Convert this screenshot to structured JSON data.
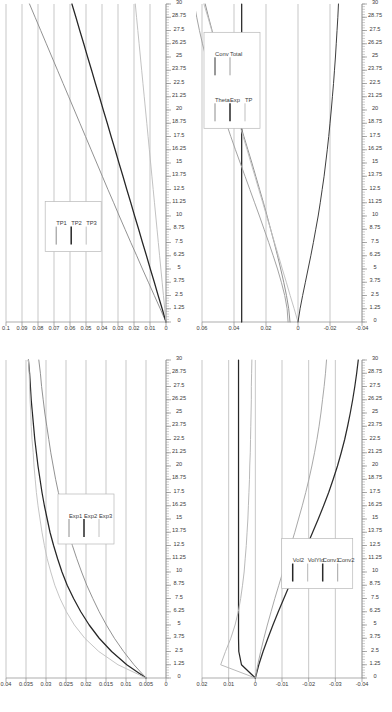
{
  "figure": {
    "layout": "2x2 grid of rotated line charts",
    "rotation_degrees": -90,
    "background": "#ffffff",
    "axis_color": "#8a8a8a",
    "grid_color": "#b0b0b0"
  },
  "x_axis_shared": {
    "label": "",
    "min": 0,
    "max": 30,
    "major_step": 1.25,
    "ticks": [
      "0",
      "1.25",
      "2.5",
      "3.75",
      "5",
      "6.25",
      "7.5",
      "8.75",
      "10",
      "11.25",
      "12.5",
      "13.75",
      "15",
      "16.25",
      "17.5",
      "18.75",
      "20",
      "21.25",
      "22.5",
      "23.75",
      "25",
      "26.25",
      "27.5",
      "28.75",
      "30"
    ]
  },
  "chart_data": [
    {
      "id": "panel-top-left",
      "type": "line",
      "title": "",
      "xlabel": "",
      "ylabel": "",
      "xlim": [
        0,
        30
      ],
      "ylim": [
        0,
        0.1
      ],
      "grid": true,
      "legend_position": "center-left",
      "x_ticks": [
        "0",
        "1.25",
        "2.5",
        "3.75",
        "5",
        "6.25",
        "7.5",
        "8.75",
        "10",
        "11.25",
        "12.5",
        "13.75",
        "15",
        "16.25",
        "17.5",
        "18.75",
        "20",
        "21.25",
        "22.5",
        "23.75",
        "25",
        "26.25",
        "27.5",
        "28.75",
        "30"
      ],
      "y_ticks": [
        "0",
        "0.01",
        "0.02",
        "0.03",
        "0.04",
        "0.05",
        "0.06",
        "0.07",
        "0.08",
        "0.09",
        "0.1"
      ],
      "x": [
        0,
        1.25,
        2.5,
        3.75,
        5,
        6.25,
        7.5,
        8.75,
        10,
        11.25,
        12.5,
        13.75,
        15,
        16.25,
        17.5,
        18.75,
        20,
        21.25,
        22.5,
        23.75,
        25,
        26.25,
        27.5,
        28.75,
        30
      ],
      "series": [
        {
          "name": "TP1",
          "color": "#8c8c8c",
          "values": [
            0,
            0.0036,
            0.0073,
            0.011,
            0.0147,
            0.0183,
            0.022,
            0.0256,
            0.0292,
            0.0327,
            0.0363,
            0.0398,
            0.0433,
            0.0468,
            0.0503,
            0.0538,
            0.0573,
            0.0608,
            0.0643,
            0.0678,
            0.0713,
            0.0748,
            0.0783,
            0.0818,
            0.0853
          ]
        },
        {
          "name": "TP2",
          "color": "#262626",
          "values": [
            0,
            0.0024,
            0.0049,
            0.0073,
            0.0098,
            0.0122,
            0.0147,
            0.0171,
            0.0196,
            0.022,
            0.0245,
            0.0269,
            0.0294,
            0.0318,
            0.0343,
            0.0367,
            0.0392,
            0.0416,
            0.0441,
            0.0465,
            0.049,
            0.0514,
            0.0539,
            0.0563,
            0.0588
          ]
        },
        {
          "name": "TP3",
          "color": "#bfbfbf",
          "values": [
            0,
            0.0008,
            0.0016,
            0.0024,
            0.0032,
            0.004,
            0.0048,
            0.0056,
            0.0064,
            0.0072,
            0.008,
            0.0088,
            0.0096,
            0.0104,
            0.0112,
            0.012,
            0.0128,
            0.0136,
            0.0144,
            0.0152,
            0.016,
            0.0168,
            0.0176,
            0.0184,
            0.0192
          ]
        }
      ]
    },
    {
      "id": "panel-top-right",
      "type": "line",
      "title": "",
      "xlabel": "",
      "ylabel": "",
      "xlim": [
        0,
        30
      ],
      "ylim": [
        -0.04,
        0.06
      ],
      "grid": true,
      "legend_position": "upper-right",
      "legend_columns": 2,
      "x_ticks": [
        "0",
        "1.25",
        "2.5",
        "3.75",
        "5",
        "6.25",
        "7.5",
        "8.75",
        "10",
        "11.25",
        "12.5",
        "13.75",
        "15",
        "16.25",
        "17.5",
        "18.75",
        "20",
        "21.25",
        "22.5",
        "23.75",
        "25",
        "26.25",
        "27.5",
        "28.75",
        "30"
      ],
      "y_ticks": [
        "-0.04",
        "-0.02",
        "0",
        "0.02",
        "0.04",
        "0.06"
      ],
      "x": [
        0,
        1.25,
        2.5,
        3.75,
        5,
        6.25,
        7.5,
        8.75,
        10,
        11.25,
        12.5,
        13.75,
        15,
        16.25,
        17.5,
        18.75,
        20,
        21.25,
        22.5,
        23.75,
        25,
        26.25,
        27.5,
        28.75,
        30
      ],
      "series": [
        {
          "name": "Theta",
          "color": "#8c8c8c",
          "values": [
            0.005,
            0.0058,
            0.0072,
            0.0089,
            0.0108,
            0.0128,
            0.0149,
            0.0171,
            0.0193,
            0.0216,
            0.024,
            0.0264,
            0.0288,
            0.0313,
            0.0338,
            0.0363,
            0.0389,
            0.0414,
            0.044,
            0.0465,
            0.049,
            0.0514,
            0.0537,
            0.0559,
            0.058
          ]
        },
        {
          "name": "Exp",
          "color": "#262626",
          "values": [
            0.0352,
            0.0352,
            0.0352,
            0.0352,
            0.0352,
            0.0352,
            0.0352,
            0.0352,
            0.0352,
            0.0352,
            0.0352,
            0.0352,
            0.0352,
            0.0352,
            0.0352,
            0.0352,
            0.0352,
            0.0352,
            0.0352,
            0.0352,
            0.0352,
            0.0352,
            0.0352,
            0.0352,
            0.0352
          ]
        },
        {
          "name": "TP",
          "color": "#bfbfbf",
          "values": [
            0,
            0.0024,
            0.0049,
            0.0073,
            0.0098,
            0.0122,
            0.0147,
            0.0171,
            0.0196,
            0.022,
            0.0245,
            0.0269,
            0.0294,
            0.0318,
            0.0343,
            0.0367,
            0.0392,
            0.0416,
            0.0441,
            0.0465,
            0.049,
            0.0514,
            0.0539,
            0.0563,
            0.0588
          ]
        },
        {
          "name": "Conv",
          "color": "#333333",
          "values": [
            0,
            -0.0013,
            -0.0029,
            -0.0046,
            -0.0063,
            -0.008,
            -0.0096,
            -0.0111,
            -0.0126,
            -0.0139,
            -0.0151,
            -0.0163,
            -0.0173,
            -0.0183,
            -0.0192,
            -0.02,
            -0.0208,
            -0.0215,
            -0.0222,
            -0.0228,
            -0.0234,
            -0.0239,
            -0.0244,
            -0.0249,
            -0.0253
          ]
        },
        {
          "name": "Total",
          "color": "#9e9e9e",
          "values": [
            0.0062,
            0.0068,
            0.0083,
            0.0104,
            0.0128,
            0.0155,
            0.0183,
            0.0212,
            0.0241,
            0.0271,
            0.0301,
            0.0331,
            0.0361,
            0.0391,
            0.042,
            0.0448,
            0.0476,
            0.0503,
            0.0529,
            0.0553,
            0.0576,
            0.0597,
            0.0616,
            0.0633,
            0.0648
          ]
        }
      ]
    },
    {
      "id": "panel-bottom-left",
      "type": "line",
      "title": "",
      "xlabel": "",
      "ylabel": "",
      "xlim": [
        0,
        30
      ],
      "ylim": [
        0,
        0.04
      ],
      "grid": true,
      "legend_position": "center",
      "x_ticks": [
        "0",
        "1.25",
        "2.5",
        "3.75",
        "5",
        "6.25",
        "7.5",
        "8.75",
        "10",
        "11.25",
        "12.5",
        "13.75",
        "15",
        "16.25",
        "17.5",
        "18.75",
        "20",
        "21.25",
        "22.5",
        "23.75",
        "25",
        "26.25",
        "27.5",
        "28.75",
        "30"
      ],
      "y_ticks": [
        "0",
        "0.005",
        "0.01",
        "0.015",
        "0.02",
        "0.025",
        "0.03",
        "0.035",
        "0.04"
      ],
      "x": [
        0,
        1.25,
        2.5,
        3.75,
        5,
        6.25,
        7.5,
        8.75,
        10,
        11.25,
        12.5,
        13.75,
        15,
        16.25,
        17.5,
        18.75,
        20,
        21.25,
        22.5,
        23.75,
        25,
        26.25,
        27.5,
        28.75,
        30
      ],
      "series": [
        {
          "name": "Exp1",
          "color": "#8c8c8c",
          "values": [
            0.005,
            0.008,
            0.0106,
            0.0129,
            0.0149,
            0.0167,
            0.0183,
            0.0198,
            0.0211,
            0.0223,
            0.0234,
            0.0244,
            0.0253,
            0.0261,
            0.0269,
            0.0276,
            0.0282,
            0.0288,
            0.0293,
            0.0298,
            0.0303,
            0.0307,
            0.0311,
            0.0314,
            0.0318
          ]
        },
        {
          "name": "Exp2",
          "color": "#262626",
          "values": [
            0.005,
            0.0098,
            0.0136,
            0.0167,
            0.0192,
            0.0213,
            0.0231,
            0.0247,
            0.026,
            0.0271,
            0.0281,
            0.029,
            0.0297,
            0.0304,
            0.031,
            0.0315,
            0.032,
            0.0324,
            0.0328,
            0.0331,
            0.0334,
            0.0337,
            0.0339,
            0.0341,
            0.0344
          ]
        },
        {
          "name": "Exp3",
          "color": "#c2c2c2",
          "values": [
            0.005,
            0.012,
            0.0168,
            0.0203,
            0.0229,
            0.0249,
            0.0265,
            0.0278,
            0.0288,
            0.0297,
            0.0304,
            0.031,
            0.0315,
            0.032,
            0.0324,
            0.0327,
            0.033,
            0.0332,
            0.0335,
            0.0337,
            0.0338,
            0.034,
            0.0341,
            0.0342,
            0.0344
          ]
        }
      ]
    },
    {
      "id": "panel-bottom-right",
      "type": "line",
      "title": "",
      "xlabel": "",
      "ylabel": "",
      "xlim": [
        0,
        30
      ],
      "ylim": [
        -0.04,
        0.02
      ],
      "grid": true,
      "legend_position": "lower-center",
      "x_ticks": [
        "0",
        "1.25",
        "2.5",
        "3.75",
        "5",
        "6.25",
        "7.5",
        "8.75",
        "10",
        "11.25",
        "12.5",
        "13.75",
        "15",
        "16.25",
        "17.5",
        "18.75",
        "20",
        "21.25",
        "22.5",
        "23.75",
        "25",
        "26.25",
        "27.5",
        "28.75",
        "30"
      ],
      "y_ticks": [
        "-0.04",
        "-0.03",
        "-0.02",
        "-0.01",
        "0",
        "0.01",
        "0.02"
      ],
      "x": [
        0,
        1.25,
        2.5,
        3.75,
        5,
        6.25,
        7.5,
        8.75,
        10,
        11.25,
        12.5,
        13.75,
        15,
        16.25,
        17.5,
        18.75,
        20,
        21.25,
        22.5,
        23.75,
        25,
        26.25,
        27.5,
        28.75,
        30
      ],
      "series": [
        {
          "name": "Vol2",
          "color": "#262626",
          "values": [
            0,
            0.0052,
            0.0062,
            0.0063,
            0.0063,
            0.0063,
            0.0063,
            0.0063,
            0.0063,
            0.0063,
            0.0063,
            0.0063,
            0.0063,
            0.0063,
            0.0063,
            0.0063,
            0.0063,
            0.0063,
            0.0063,
            0.0063,
            0.0063,
            0.0063,
            0.0063,
            0.0063,
            0.0063
          ]
        },
        {
          "name": "VolYld",
          "color": "#b5b5b5",
          "values": [
            0,
            0.013,
            0.0112,
            0.0092,
            0.0076,
            0.0064,
            0.0055,
            0.0048,
            0.0042,
            0.0038,
            0.0034,
            0.0031,
            0.0028,
            0.0026,
            0.0024,
            0.0022,
            0.0021,
            0.0019,
            0.0018,
            0.0017,
            0.0016,
            0.0015,
            0.0015,
            0.0014,
            0.0013
          ]
        },
        {
          "name": "Conv1",
          "color": "#2b2b2b",
          "values": [
            0,
            -0.0013,
            -0.0029,
            -0.0047,
            -0.0066,
            -0.0086,
            -0.0107,
            -0.0128,
            -0.015,
            -0.0172,
            -0.0194,
            -0.0215,
            -0.0236,
            -0.0256,
            -0.0275,
            -0.0292,
            -0.0308,
            -0.0322,
            -0.0335,
            -0.0346,
            -0.0356,
            -0.0365,
            -0.0373,
            -0.038,
            -0.0386
          ]
        },
        {
          "name": "Conv2",
          "color": "#a3a3a3",
          "values": [
            0,
            -0.0009,
            -0.002,
            -0.0032,
            -0.0045,
            -0.0059,
            -0.0073,
            -0.0088,
            -0.0103,
            -0.0118,
            -0.0133,
            -0.0148,
            -0.0162,
            -0.0176,
            -0.0189,
            -0.0201,
            -0.0212,
            -0.0222,
            -0.0231,
            -0.0239,
            -0.0246,
            -0.0252,
            -0.0258,
            -0.0263,
            -0.0267
          ]
        }
      ]
    }
  ]
}
